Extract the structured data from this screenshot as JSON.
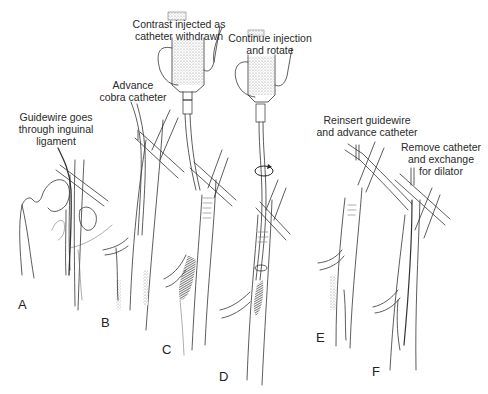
{
  "figure": {
    "type": "medical-procedure-illustration",
    "panels": [
      {
        "letter": "A",
        "caption": [
          "Guidewire goes",
          "through inguinal",
          "ligament"
        ]
      },
      {
        "letter": "B",
        "caption": [
          "Advance",
          "cobra catheter"
        ]
      },
      {
        "letter": "C",
        "caption": [
          "Contrast injected as",
          "catheter withdrawn"
        ]
      },
      {
        "letter": "D",
        "caption": [
          "Continue injection",
          "and rotate"
        ]
      },
      {
        "letter": "E",
        "caption": [
          "Reinsert guidewire",
          "and advance catheter"
        ]
      },
      {
        "letter": "F",
        "caption": [
          "Remove catheter",
          "and exchange",
          "for dilator"
        ]
      }
    ],
    "icons": {
      "rotate": "rotate-arrow-icon",
      "syringe": "syringe-icon"
    },
    "colors": {
      "line": "#333333",
      "shade": "#999999",
      "background": "#ffffff"
    }
  }
}
